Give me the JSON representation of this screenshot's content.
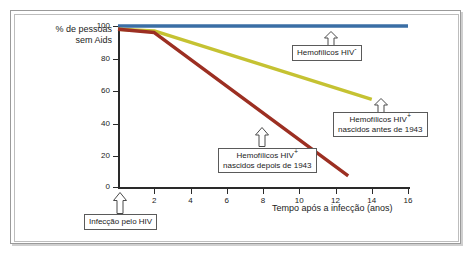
{
  "chart_data": {
    "type": "line",
    "title": "",
    "xlabel": "Tempo após a infecção (anos)",
    "ylabel": "% de pessoas sem Aids",
    "xlim": [
      0,
      16
    ],
    "ylim": [
      0,
      100
    ],
    "xticks": [
      0,
      2,
      4,
      6,
      8,
      10,
      12,
      14,
      16
    ],
    "yticks": [
      0,
      20,
      40,
      60,
      80,
      100
    ],
    "grid": false,
    "legend_position": "annotations",
    "series": [
      {
        "name": "Hemofílicos HIV-",
        "color": "#3a6ea5",
        "x": [
          0,
          2,
          16
        ],
        "values": [
          100,
          100,
          100
        ]
      },
      {
        "name": "Hemofílicos HIV+ nascidos antes de 1943",
        "color": "#c5c232",
        "x": [
          0,
          2,
          14
        ],
        "values": [
          98,
          97,
          55
        ]
      },
      {
        "name": "Hemofílicos HIV+ nascidos depois de 1943",
        "color": "#9c2f22",
        "x": [
          0,
          2,
          12.7
        ],
        "values": [
          98,
          96,
          8
        ]
      }
    ],
    "annotations": [
      {
        "id": "blue-callout",
        "text_line1": "Hemofílicos HIV",
        "sup": "-",
        "text_line2": ""
      },
      {
        "id": "yellow-callout",
        "text_line1": "Hemofílicos HIV",
        "sup": "+",
        "text_line2": "nascidos antes de 1943"
      },
      {
        "id": "red-callout",
        "text_line1": "Hemofílicos HIV",
        "sup": "+",
        "text_line2": "nascidos depois de 1943"
      },
      {
        "id": "origin-callout",
        "text_line1": "Infecção pelo HIV",
        "sup": "",
        "text_line2": ""
      }
    ]
  },
  "axes": {
    "y_title_line1": "% de pessoas",
    "y_title_line2": "sem Aids",
    "x_title": "Tempo após a infecção (anos)",
    "y_labels": [
      "100",
      "80",
      "60",
      "40",
      "20",
      "0"
    ],
    "x_labels": [
      "2",
      "4",
      "6",
      "8",
      "10",
      "12",
      "14",
      "16"
    ],
    "x_origin_label": "0"
  },
  "callouts": {
    "blue": {
      "line1_prefix": "Hemofílicos HIV",
      "line1_sup": "-",
      "line2": ""
    },
    "yellow": {
      "line1_prefix": "Hemofílicos HIV",
      "line1_sup": "+",
      "line2": "nascidos antes de 1943"
    },
    "red": {
      "line1_prefix": "Hemofílicos HIV",
      "line1_sup": "+",
      "line2": "nascidos depois de 1943"
    },
    "origin": {
      "line1_prefix": "Infecção pelo HIV",
      "line1_sup": "",
      "line2": ""
    }
  },
  "colors": {
    "blue_line": "#3a6ea5",
    "yellow_line": "#c5c232",
    "red_line": "#9c2f22",
    "axis": "#2a2a2a",
    "frame": "#9a9a9a",
    "background": "#ffffff"
  }
}
